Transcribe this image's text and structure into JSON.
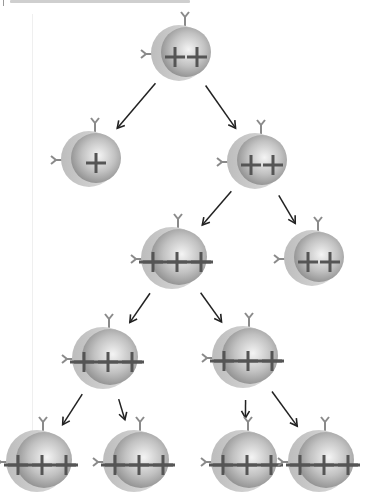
{
  "header": {
    "text": ""
  },
  "diagram": {
    "title": "",
    "colors": {
      "shell": "#c9c9c9",
      "body_light": "#f2f2f2",
      "body_dark": "#8f8f8f",
      "mark": "#555555",
      "arrow": "#222222",
      "receptor": "#8a8a8a"
    },
    "cells": [
      {
        "id": "c0",
        "level": 0,
        "marks": 2,
        "label": "++"
      },
      {
        "id": "c1",
        "level": 1,
        "marks": 1,
        "label": "+"
      },
      {
        "id": "c2",
        "level": 1,
        "marks": 2,
        "label": "++"
      },
      {
        "id": "c3",
        "level": 2,
        "marks": 3,
        "label": "+++"
      },
      {
        "id": "c4",
        "level": 2,
        "marks": 2,
        "label": "++"
      },
      {
        "id": "c5",
        "level": 3,
        "marks": 3,
        "label": "+++"
      },
      {
        "id": "c6",
        "level": 3,
        "marks": 3,
        "label": "+++"
      },
      {
        "id": "c7",
        "level": 4,
        "marks": 3,
        "label": "+++"
      },
      {
        "id": "c8",
        "level": 4,
        "marks": 3,
        "label": "+++"
      },
      {
        "id": "c9",
        "level": 4,
        "marks": 3,
        "label": "+++"
      },
      {
        "id": "c10",
        "level": 4,
        "marks": 3,
        "label": "+++"
      }
    ],
    "edges": [
      [
        "c0",
        "c1"
      ],
      [
        "c0",
        "c2"
      ],
      [
        "c2",
        "c3"
      ],
      [
        "c2",
        "c4"
      ],
      [
        "c3",
        "c5"
      ],
      [
        "c3",
        "c6"
      ],
      [
        "c5",
        "c7"
      ],
      [
        "c5",
        "c8"
      ],
      [
        "c6",
        "c9"
      ],
      [
        "c6",
        "c10"
      ]
    ]
  }
}
